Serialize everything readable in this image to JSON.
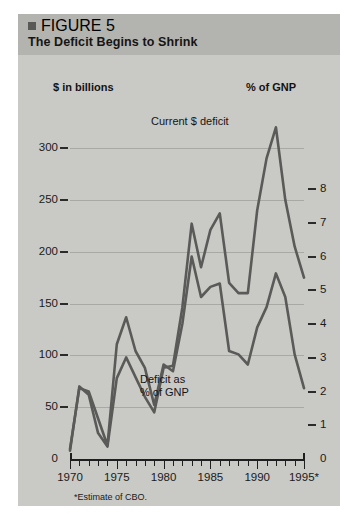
{
  "figure": {
    "marker": "square-marker",
    "number": "FIGURE 5",
    "title": "The Deficit Begins to Shrink"
  },
  "footnote": "*Estimate of CBO.",
  "annotations": {
    "current_deficit": "Current $ deficit",
    "deficit_pct_gnp": "Deficit as\n% of GNP"
  },
  "colors": {
    "panel_bg": "#c9c9c6",
    "title_bg": "#b3b3b0",
    "line": "#5a5a58",
    "grid": "#a8a8a4",
    "axis": "#1f1f1f",
    "text": "#151515"
  },
  "chart_data": {
    "type": "line",
    "title": "The Deficit Begins to Shrink",
    "subtitle": "FIGURE 5",
    "xlabel": "",
    "ylabel": "$ in billions",
    "y2label": "% of GNP",
    "grid": true,
    "legend_position": "inline-annotations",
    "xlim": [
      1970,
      1995
    ],
    "ylim": [
      0,
      320
    ],
    "y2lim": [
      0,
      8.5
    ],
    "yticks": [
      0,
      50,
      100,
      150,
      200,
      250,
      300
    ],
    "ytick_labels": [
      "0",
      "50",
      "100",
      "150",
      "200",
      "250",
      "300"
    ],
    "y2ticks": [
      0,
      1,
      2,
      3,
      4,
      5,
      6,
      7,
      8
    ],
    "y2tick_labels": [
      "0",
      "1",
      "2",
      "3",
      "4",
      "5",
      "6",
      "7",
      "8"
    ],
    "xticks": [
      1970,
      1975,
      1980,
      1985,
      1990,
      1995
    ],
    "xtick_labels": [
      "1970",
      "1975",
      "1980",
      "1985",
      "1990",
      "1995*"
    ],
    "x": [
      1970,
      1971,
      1972,
      1973,
      1974,
      1975,
      1976,
      1977,
      1978,
      1979,
      1980,
      1981,
      1982,
      1983,
      1984,
      1985,
      1986,
      1987,
      1988,
      1989,
      1990,
      1991,
      1992,
      1993,
      1994,
      1995
    ],
    "series": [
      {
        "name": "Current $ deficit",
        "axis": "left",
        "units": "$ in billions",
        "values": [
          8,
          70,
          62,
          25,
          12,
          78,
          98,
          79,
          60,
          45,
          88,
          90,
          146,
          227,
          185,
          221,
          237,
          170,
          160,
          160,
          240,
          290,
          320,
          250,
          205,
          175
        ]
      },
      {
        "name": "Deficit as % of GNP",
        "axis": "right",
        "units": "% of GNP",
        "values": [
          0.3,
          2.1,
          2.0,
          1.2,
          0.4,
          3.4,
          4.2,
          3.2,
          2.7,
          1.6,
          2.8,
          2.6,
          4.0,
          6.0,
          4.8,
          5.1,
          5.2,
          3.2,
          3.1,
          2.8,
          3.9,
          4.5,
          5.5,
          4.8,
          3.1,
          2.1
        ]
      }
    ]
  }
}
